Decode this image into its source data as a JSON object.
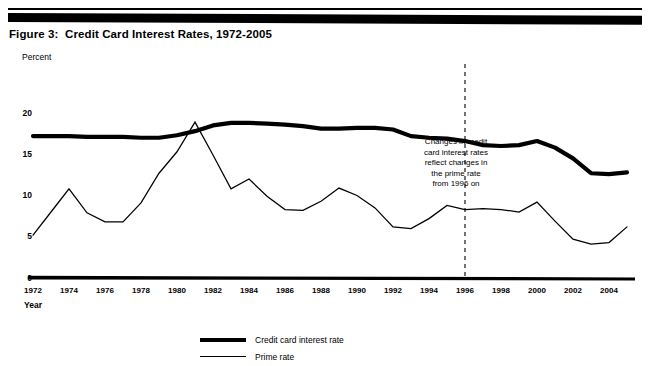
{
  "figure": {
    "title": "Figure 3:  Credit Card Interest Rates, 1972-2005"
  },
  "axes": {
    "y_caption": "Percent",
    "x_caption": "Year"
  },
  "annotation": {
    "line1": "Changes in credit",
    "line2": "card interest rates",
    "line3": "reflect changes in",
    "line4": "the prime rate",
    "line5": "from 1996 on",
    "marker_year": 1996
  },
  "legend": {
    "position": "bottom-center",
    "items": [
      {
        "label": "Credit card interest rate",
        "style": "thick",
        "color": "#000000"
      },
      {
        "label": "Prime rate",
        "style": "thin",
        "color": "#000000"
      }
    ]
  },
  "chart_data": {
    "type": "line",
    "title": "Figure 3:  Credit Card Interest Rates, 1972-2005",
    "xlabel": "Year",
    "ylabel": "Percent",
    "xlim": [
      1972,
      2005
    ],
    "ylim": [
      0,
      20
    ],
    "yticks": [
      0,
      5,
      10,
      15,
      20
    ],
    "ytick_labels": [
      "0",
      "5",
      "10",
      "15",
      "20"
    ],
    "xticks": [
      1972,
      1974,
      1976,
      1978,
      1980,
      1982,
      1984,
      1986,
      1988,
      1990,
      1992,
      1994,
      1996,
      1998,
      2000,
      2002,
      2004
    ],
    "xtick_labels": [
      "1972",
      "1974",
      "1976",
      "1978",
      "1980",
      "1982",
      "1984",
      "1986",
      "1988",
      "1990",
      "1992",
      "1994",
      "1996",
      "1998",
      "2000",
      "2002",
      "2004"
    ],
    "grid": false,
    "legend_position": "bottom-center",
    "x": [
      1972,
      1973,
      1974,
      1975,
      1976,
      1977,
      1978,
      1979,
      1980,
      1981,
      1982,
      1983,
      1984,
      1985,
      1986,
      1987,
      1988,
      1989,
      1990,
      1991,
      1992,
      1993,
      1994,
      1995,
      1996,
      1997,
      1998,
      1999,
      2000,
      2001,
      2002,
      2003,
      2004,
      2005
    ],
    "series": [
      {
        "name": "Credit card interest rate",
        "style": "thick",
        "color": "#000000",
        "values": [
          17.2,
          17.2,
          17.2,
          17.1,
          17.1,
          17.1,
          17.0,
          17.0,
          17.3,
          17.8,
          18.5,
          18.8,
          18.8,
          18.7,
          18.6,
          18.4,
          18.1,
          18.1,
          18.2,
          18.2,
          18.0,
          17.2,
          17.0,
          16.9,
          16.6,
          16.1,
          16.0,
          16.1,
          16.6,
          15.8,
          14.5,
          12.7,
          12.6,
          12.8
        ],
        "peak": {
          "year": 1984,
          "value": 18.8
        },
        "min": {
          "year": 2003,
          "value": 12.7
        }
      },
      {
        "name": "Prime rate",
        "style": "thin",
        "color": "#000000",
        "values": [
          5.2,
          8.0,
          10.8,
          7.9,
          6.8,
          6.8,
          9.1,
          12.7,
          15.3,
          18.9,
          14.9,
          10.8,
          12.0,
          9.9,
          8.3,
          8.2,
          9.3,
          10.9,
          10.0,
          8.5,
          6.2,
          6.0,
          7.2,
          8.8,
          8.3,
          8.4,
          8.3,
          8.0,
          9.2,
          6.9,
          4.7,
          4.1,
          4.3,
          6.2
        ],
        "peak": {
          "year": 1981,
          "value": 18.9
        },
        "min": {
          "year": 2003,
          "value": 4.1
        }
      }
    ]
  }
}
